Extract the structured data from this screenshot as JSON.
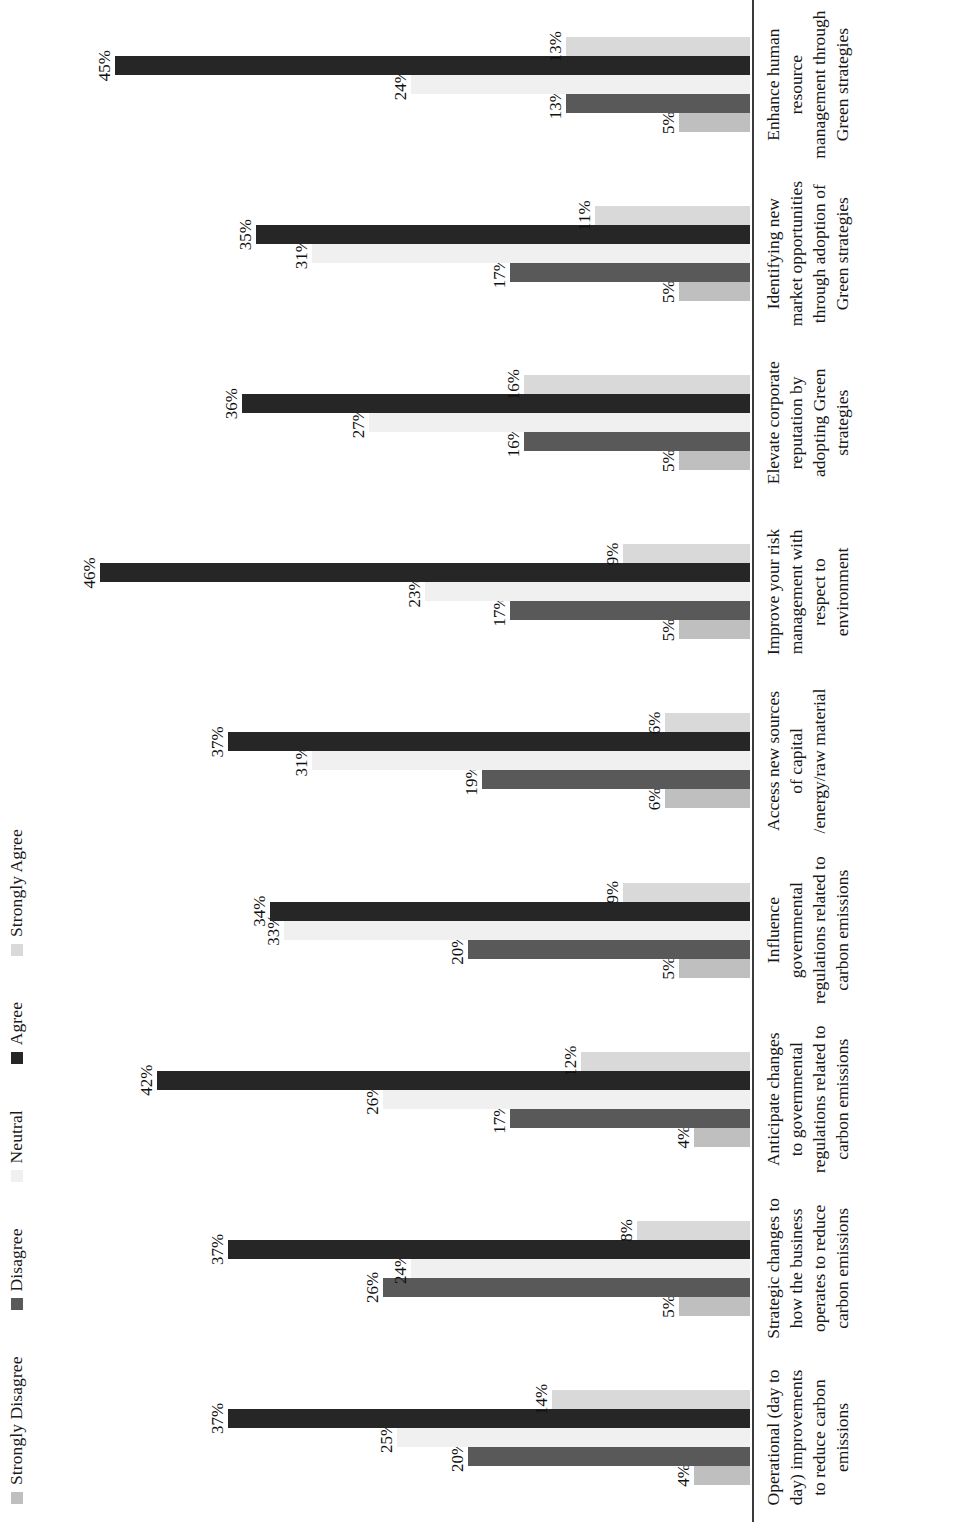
{
  "chart_data": {
    "type": "bar",
    "orientation": "horizontal-grouped-rotated",
    "title": "",
    "subtitle": "",
    "xlabel": "",
    "ylabel": "",
    "value_suffix": "%",
    "ylim": [
      0,
      50
    ],
    "grid": false,
    "legend_position": "top-left",
    "categories": [
      "Operational (day to day) improvements to reduce carbon emissions",
      "Strategic changes to how the business operates to reduce carbon emissions",
      "Anticipate changes to governmental regulations related to carbon emissions",
      "Influence governmental regulations related to carbon emissions",
      "Access new sources of capital /energy/raw material",
      "Improve your risk management with respect to environment",
      "Elevate corporate reputation by adopting Green strategies",
      "Identifying new market opportunities through adoption of Green strategies",
      "Enhance human resource management through Green strategies"
    ],
    "series": [
      {
        "name": "Strongly Disagree",
        "color": "#bfbfbf",
        "values": [
          4,
          5,
          4,
          5,
          6,
          5,
          5,
          5,
          5
        ],
        "labels": [
          "4%",
          "5%",
          "4%",
          "5%",
          "6%",
          "5%",
          "5%",
          "5%",
          "5%"
        ]
      },
      {
        "name": "Disagree",
        "color": "#595959",
        "values": [
          20,
          26,
          17,
          20,
          19,
          17,
          16,
          17,
          13
        ],
        "labels": [
          "20%",
          "26%",
          "17%",
          "20%",
          "19%",
          "17%",
          "16%",
          "17%",
          "13%"
        ]
      },
      {
        "name": "Neutral",
        "color": "#f0f0f0",
        "values": [
          25,
          24,
          26,
          33,
          31,
          23,
          27,
          31,
          24
        ],
        "labels": [
          "25%",
          "24%",
          "26%",
          "33%",
          "31%",
          "23%",
          "27%",
          "31%",
          "24%"
        ]
      },
      {
        "name": "Agree",
        "color": "#262626",
        "values": [
          37,
          37,
          42,
          34,
          37,
          46,
          36,
          35,
          45
        ],
        "labels": [
          "37%",
          "37%",
          "42%",
          "34%",
          "37%",
          "46%",
          "36%",
          "35%",
          "45%"
        ]
      },
      {
        "name": "Strongly Agree",
        "color": "#d9d9d9",
        "values": [
          14,
          8,
          12,
          9,
          6,
          9,
          16,
          11,
          13
        ],
        "labels": [
          "14%",
          "8%",
          "12%",
          "9%",
          "6%",
          "9%",
          "16%",
          "11%",
          "13%"
        ]
      }
    ]
  },
  "legend": {
    "items": [
      {
        "label": "Strongly Disagree",
        "color": "#bfbfbf"
      },
      {
        "label": "Disagree",
        "color": "#595959"
      },
      {
        "label": "Neutral",
        "color": "#f0f0f0"
      },
      {
        "label": "Agree",
        "color": "#262626"
      },
      {
        "label": "Strongly Agree",
        "color": "#d9d9d9"
      }
    ]
  }
}
